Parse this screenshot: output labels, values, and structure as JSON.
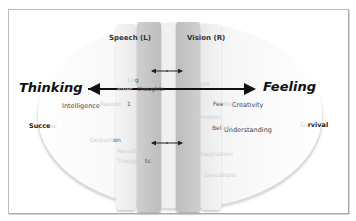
{
  "diagram": {
    "headers": {
      "left": "Speech (L)",
      "right": "Vision (R)"
    },
    "axis": {
      "left_label": "Thinking",
      "right_label": "Feeling"
    },
    "left_labels": {
      "intelligence": "Intelligence",
      "success": "Succe",
      "success_faint": "ss"
    },
    "right_labels": {
      "creativity": "Creativity",
      "survival": "rvival",
      "survival_faint": "Su",
      "understanding": "Understanding"
    },
    "left_column_text": {
      "row1_faint": "Lo",
      "row1_dark": "g",
      "row2_faint": "Inner",
      "row2_dark": "thoughts",
      "row3_faint": "Reason",
      "row3_dark": "1",
      "row4_faint": "Deducti",
      "row4_dark": "on",
      "row5_faint": "Result",
      "row6_faint": "Thoughts",
      "row6_dark": "ts"
    },
    "right_column_text": {
      "row1_faint": "Sight",
      "row2_dark": "Fee",
      "row2_faint": "lings",
      "row3_faint": "Emotion",
      "row4_dark": "Bel",
      "row4_faint": "iefs",
      "row5_faint": "Imagination",
      "row6_faint": "Sensations"
    },
    "colors": {
      "frame": "#bdbdbd",
      "column_dark": "#c4c4c4",
      "column_light": "#ededed",
      "arrow": "#111111"
    }
  }
}
